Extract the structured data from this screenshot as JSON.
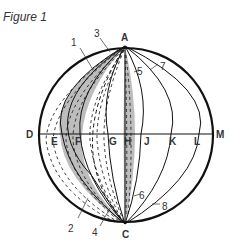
{
  "figure": {
    "caption": "Figure 1"
  },
  "points": {
    "A": "A",
    "C": "C",
    "D": "D",
    "M": "M",
    "E": "E",
    "F": "F",
    "G": "G",
    "H": "H",
    "J": "J",
    "K": "K",
    "L": "L"
  },
  "callouts": [
    "1",
    "2",
    "3",
    "4",
    "5",
    "6",
    "7",
    "8"
  ],
  "colors": {
    "stroke": "#111111",
    "shade": "#bdbdbd",
    "background": "#ffffff"
  }
}
